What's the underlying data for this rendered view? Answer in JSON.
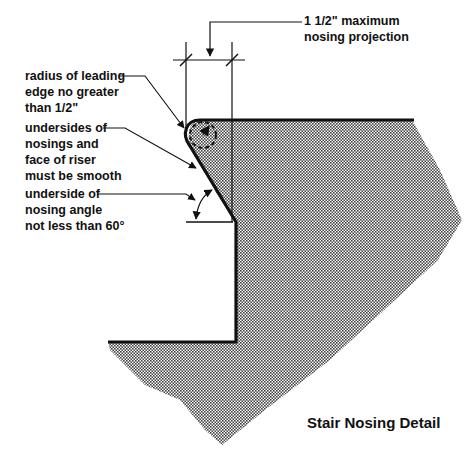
{
  "diagram": {
    "title": "Stair Nosing Detail",
    "colors": {
      "ink": "#111111",
      "hatch": "#555555",
      "background": "#ffffff"
    },
    "callouts": {
      "projection": {
        "line1": "1  1/2\" maximum",
        "line2": "nosing projection"
      },
      "radius": {
        "line1": "radius of leading",
        "line2": "edge no greater",
        "line3": "than 1/2\""
      },
      "smooth": {
        "line1": "undersides of",
        "line2": "nosings and",
        "line3": "face of riser",
        "line4": "must be smooth"
      },
      "angle": {
        "line1": "underside of",
        "line2": "nosing angle",
        "line3": "not less than 60°"
      }
    }
  }
}
